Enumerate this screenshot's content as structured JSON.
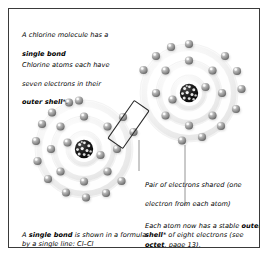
{
  "figure": {
    "border_color": "#3a3a3a",
    "background": "#ffffff"
  },
  "captions": {
    "intro_line1": "A chlorine molecule has a",
    "intro_bold": "single bond",
    "seven_line1": "Chlorine atoms each have",
    "seven_line2": "seven electrons in their",
    "seven_bold": "outer shell",
    "seven_after_bold": "*.",
    "pair_line1": "Pair of electrons shared (one",
    "pair_line2": "electron from each atom)",
    "bond_pre": "A ",
    "bond_bold": "single bond",
    "bond_post": " is shown in a formula by a single line: Cl–Cl",
    "octet_pre": "Each atom now has a stable ",
    "octet_bold1": "outer shell",
    "octet_mid": "* of eight electrons (see ",
    "octet_bold2": "octet",
    "octet_post": ", page 13)."
  },
  "diagram": {
    "type": "atomic-shell-model",
    "element": "chlorine",
    "molecule_formula": "Cl–Cl",
    "electrons_per_atom_outer_shell": 7,
    "electrons_after_bonding": 8,
    "shared_electron_pair_count": 2,
    "shell_counts": [
      2,
      8,
      7
    ],
    "colors": {
      "nucleus": "#161616",
      "nucleus_speck": "#ffffff",
      "electron": "#8d8d8d",
      "electron_highlight": "#e8e8e8",
      "electron_shadow": "#4f4f4f",
      "shell_band": "#ededed",
      "shell_line": "#d6d6d6",
      "highlight_box": "#2b2b2b",
      "leader_line": "#7a7a7a"
    },
    "atoms": [
      {
        "name": "left-atom",
        "cx": 75,
        "cy": 140,
        "shell_radii": [
          17,
          31,
          49
        ]
      },
      {
        "name": "right-atom",
        "cx": 180,
        "cy": 84,
        "shell_radii": [
          17,
          31,
          49
        ]
      }
    ],
    "highlight_box": {
      "name": "shared-pair-highlight",
      "angle_deg": 35
    },
    "leaders": [
      {
        "name": "pair-leader-line",
        "from": [
          130,
          130
        ],
        "to": [
          130,
          162
        ]
      },
      {
        "name": "octet-leader-line",
        "from": [
          176,
          134
        ],
        "to": [
          176,
          198
        ]
      }
    ]
  }
}
